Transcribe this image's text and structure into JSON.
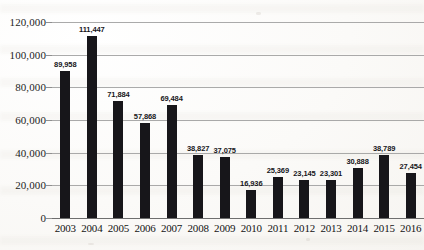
{
  "chart_data": {
    "type": "bar",
    "title": "",
    "subtitle": "",
    "xlabel": "",
    "ylabel": "",
    "categories": [
      "2003",
      "2004",
      "2005",
      "2006",
      "2007",
      "2008",
      "2009",
      "2010",
      "2011",
      "2012",
      "2013",
      "2014",
      "2015",
      "2016"
    ],
    "values": [
      89958,
      111447,
      71884,
      57868,
      69484,
      38827,
      37075,
      16936,
      25369,
      23145,
      23301,
      30888,
      38789,
      27454
    ],
    "value_labels": [
      "89,958",
      "111,447",
      "71,884",
      "57,868",
      "69,484",
      "38,827",
      "37,075",
      "16,936",
      "25,369",
      "23,145",
      "23,301",
      "30,888",
      "38,789",
      "27,454"
    ],
    "ylim": [
      0,
      120000
    ],
    "ytick_values": [
      0,
      20000,
      40000,
      60000,
      80000,
      100000,
      120000
    ],
    "ytick_labels": [
      "0",
      "20,000",
      "40,000",
      "60,000",
      "80,000",
      "100,000",
      "120,000"
    ],
    "grid": true,
    "legend": false,
    "legend_position": "none",
    "bar_color": "#17161a",
    "gridline_color": "#9b9b9b",
    "axis_color": "#6e6e6e",
    "background_color": "#fbfaf7",
    "series": [
      {
        "name": "",
        "values": [
          89958,
          111447,
          71884,
          57868,
          69484,
          38827,
          37075,
          16936,
          25369,
          23145,
          23301,
          30888,
          38789,
          27454
        ]
      }
    ]
  }
}
